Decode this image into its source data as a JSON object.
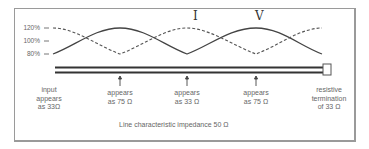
{
  "diagram": {
    "title": "",
    "y_axis_labels": [
      "120%",
      "100%",
      "80%"
    ],
    "curves": [
      {
        "name": "I",
        "style": "dashed",
        "phase": "starts high"
      },
      {
        "name": "V",
        "style": "solid",
        "phase": "starts low"
      }
    ],
    "curve_labels": {
      "current": "I",
      "voltage": "V"
    },
    "line_points": [
      {
        "label": "input appears as 33Ω",
        "lines": [
          "input",
          "appears",
          "as 33Ω"
        ]
      },
      {
        "label": "appears as 75 Ω",
        "lines": [
          "appears",
          "as 75 Ω"
        ]
      },
      {
        "label": "appears as 33 Ω",
        "lines": [
          "appears",
          "as 33 Ω"
        ]
      },
      {
        "label": "appears as 75 Ω",
        "lines": [
          "appears",
          "as 75 Ω"
        ]
      },
      {
        "label": "resistive termination of 33 Ω",
        "lines": [
          "resistive",
          "termination",
          "of 33 Ω"
        ]
      }
    ],
    "footer": "Line characteristic impedance 50 Ω",
    "colors": {
      "curve": "#444444",
      "line": "#333333",
      "border": "#9a9a9a",
      "text": "#666666"
    }
  }
}
